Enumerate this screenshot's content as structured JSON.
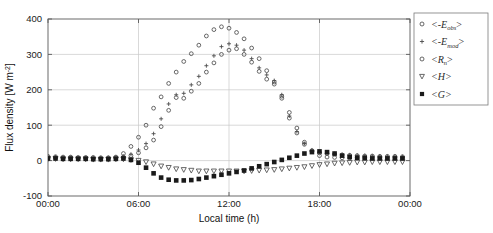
{
  "figure": {
    "background_color": "#ffffff",
    "axis_color": "#5a5a5a",
    "grid_color": "#c8c8c8",
    "marker_color": "#4d4d4d",
    "marker_color_dark": "#1a1a1a"
  },
  "axes": {
    "ylabel": "Flux density [W m",
    "ylabel_exponent": "-2",
    "ylabel_close": "]",
    "xlabel": "Local time (h)",
    "ytick_labels": [
      "400",
      "300",
      "200",
      "100",
      "0",
      "-100"
    ],
    "ytick_values": [
      400,
      300,
      200,
      100,
      0,
      -100
    ],
    "xtick_labels": [
      "00:00",
      "06:00",
      "12:00",
      "18:00",
      "00:00"
    ],
    "xtick_values": [
      0,
      6,
      12,
      18,
      24
    ]
  },
  "legend": {
    "items": [
      {
        "marker": "circle-open",
        "label": "<-E",
        "sub": "obs",
        "tail": ">",
        "name": "legend-item-e-obs"
      },
      {
        "marker": "plus",
        "label": "<-E",
        "sub": "mod",
        "tail": ">",
        "name": "legend-item-e-mod"
      },
      {
        "marker": "circle-open",
        "label": "<R",
        "sub": "n",
        "tail": ">",
        "name": "legend-item-rn"
      },
      {
        "marker": "triangle-down-open",
        "label": "<H>",
        "sub": "",
        "tail": "",
        "name": "legend-item-h"
      },
      {
        "marker": "square-filled",
        "label": "<G>",
        "sub": "",
        "tail": "",
        "name": "legend-item-g"
      }
    ]
  },
  "chart_data": {
    "type": "scatter",
    "title": "",
    "xlabel": "Local time (h)",
    "ylabel": "Flux density [W m-2]",
    "xlim": [
      0,
      24
    ],
    "ylim": [
      -100,
      400
    ],
    "grid": true,
    "legend_position": "right-outside-top",
    "x": [
      0.0,
      0.5,
      1.0,
      1.5,
      2.0,
      2.5,
      3.0,
      3.5,
      4.0,
      4.5,
      5.0,
      5.5,
      6.0,
      6.5,
      7.0,
      7.5,
      8.0,
      8.5,
      9.0,
      9.5,
      10.0,
      10.5,
      11.0,
      11.5,
      12.0,
      12.5,
      13.0,
      13.5,
      14.0,
      14.5,
      15.0,
      15.5,
      16.0,
      16.5,
      17.0,
      17.5,
      18.0,
      18.5,
      19.0,
      19.5,
      20.0,
      20.5,
      21.0,
      21.5,
      22.0,
      22.5,
      23.0,
      23.5
    ],
    "series": [
      {
        "name": "<-E_obs>",
        "marker": "circle-open",
        "values": [
          12,
          11,
          10,
          10,
          9,
          9,
          9,
          8,
          8,
          8,
          10,
          14,
          22,
          36,
          58,
          96,
          142,
          178,
          176,
          196,
          218,
          250,
          276,
          300,
          312,
          316,
          300,
          278,
          252,
          230,
          216,
          176,
          120,
          78,
          46,
          28,
          22,
          20,
          18,
          16,
          15,
          14,
          13,
          13,
          12,
          12,
          12,
          11
        ]
      },
      {
        "name": "<-E_mod>",
        "marker": "plus",
        "values": [
          10,
          10,
          9,
          9,
          8,
          8,
          8,
          8,
          8,
          9,
          12,
          18,
          30,
          48,
          76,
          118,
          160,
          186,
          190,
          214,
          238,
          268,
          296,
          322,
          330,
          326,
          312,
          288,
          262,
          242,
          226,
          186,
          126,
          82,
          48,
          30,
          24,
          21,
          19,
          17,
          16,
          15,
          14,
          13,
          13,
          12,
          12,
          11
        ]
      },
      {
        "name": "<R_n>",
        "marker": "circle-open",
        "values": [
          8,
          8,
          7,
          7,
          6,
          6,
          6,
          6,
          7,
          10,
          20,
          40,
          66,
          100,
          148,
          180,
          218,
          250,
          280,
          302,
          326,
          352,
          370,
          378,
          374,
          362,
          344,
          318,
          288,
          254,
          222,
          182,
          136,
          92,
          52,
          26,
          14,
          10,
          9,
          8,
          8,
          8,
          8,
          8,
          8,
          8,
          8,
          8
        ]
      },
      {
        "name": "<H>",
        "marker": "triangle-down-open",
        "values": [
          5,
          5,
          4,
          4,
          4,
          4,
          3,
          3,
          3,
          4,
          4,
          2,
          0,
          -4,
          -10,
          -16,
          -20,
          -24,
          -26,
          -28,
          -30,
          -30,
          -30,
          -30,
          -30,
          -30,
          -30,
          -29,
          -28,
          -27,
          -26,
          -24,
          -22,
          -20,
          -18,
          -15,
          -12,
          -10,
          -8,
          -7,
          -6,
          -5,
          -5,
          -4,
          -4,
          -4,
          -4,
          -4
        ]
      },
      {
        "name": "<G>",
        "marker": "square-filled",
        "values": [
          6,
          6,
          5,
          5,
          5,
          5,
          4,
          4,
          4,
          5,
          6,
          2,
          -6,
          -20,
          -36,
          -48,
          -54,
          -56,
          -56,
          -55,
          -52,
          -48,
          -44,
          -40,
          -36,
          -32,
          -28,
          -22,
          -16,
          -10,
          -4,
          2,
          8,
          14,
          20,
          24,
          26,
          24,
          20,
          14,
          10,
          8,
          7,
          6,
          6,
          6,
          6,
          6
        ]
      }
    ]
  }
}
